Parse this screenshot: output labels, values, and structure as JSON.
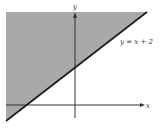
{
  "diagram": {
    "type": "inequality-graph",
    "line_label": "y = x + 2",
    "x_axis_label": "x",
    "y_axis_label": "y",
    "shaded_region": "above line",
    "colors": {
      "shade": "#a9a9a9",
      "line": "#1a1a1a",
      "axis": "#333333",
      "background": "#ffffff"
    }
  }
}
